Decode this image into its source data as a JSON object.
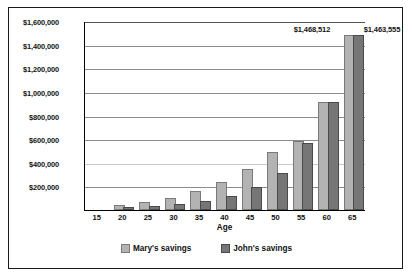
{
  "chart_data": {
    "type": "bar",
    "title": "",
    "xlabel": "Age",
    "ylabel": "",
    "categories": [
      "15",
      "20",
      "25",
      "30",
      "35",
      "40",
      "45",
      "50",
      "55",
      "60",
      "65"
    ],
    "ylim": [
      0,
      1600000
    ],
    "ytick_labels": [
      "$1,600,000",
      "$1,400,000",
      "$1,200,000",
      "$1,000,000",
      "$800,000",
      "$600,000",
      "$400,000",
      "$200,000"
    ],
    "ytick_values": [
      1600000,
      1400000,
      1200000,
      1000000,
      800000,
      600000,
      400000,
      200000
    ],
    "grid": true,
    "legend_position": "bottom",
    "series": [
      {
        "name": "Mary's savings",
        "color": "#b3b3b3",
        "values": [
          0,
          22000,
          48000,
          88000,
          145000,
          222000,
          327000,
          470000,
          570000,
          900000,
          1468512
        ]
      },
      {
        "name": "John's savings",
        "color": "#767676",
        "values": [
          0,
          6000,
          14000,
          30000,
          58000,
          105000,
          182000,
          297000,
          550000,
          895000,
          1463555
        ]
      }
    ],
    "annotations": [
      {
        "text": "$1,468,512",
        "series": "Mary's savings",
        "category": "65"
      },
      {
        "text": "$1,463,555",
        "series": "John's savings",
        "category": "65"
      }
    ]
  }
}
